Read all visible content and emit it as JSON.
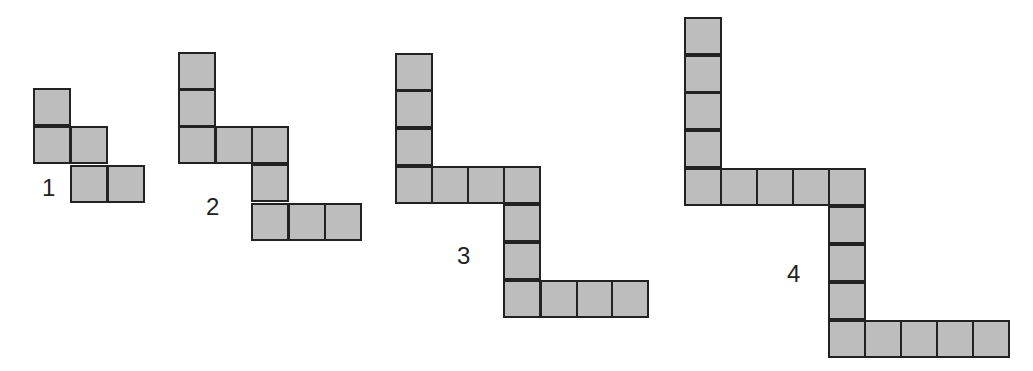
{
  "diagram": {
    "title": "",
    "colors": {
      "fill": "#bdbdbd",
      "stroke": "#222222",
      "background": "#ffffff"
    },
    "square_size": 38,
    "figures": [
      {
        "label": "1",
        "label_pos": [
          42,
          176
        ],
        "squares": [
          [
            33,
            88
          ],
          [
            33,
            126
          ],
          [
            70,
            126
          ],
          [
            70,
            165
          ],
          [
            107,
            165
          ]
        ]
      },
      {
        "label": "2",
        "label_pos": [
          206,
          195
        ],
        "squares": [
          [
            178,
            52
          ],
          [
            178,
            89
          ],
          [
            178,
            126
          ],
          [
            215,
            126
          ],
          [
            251,
            126
          ],
          [
            251,
            164
          ],
          [
            251,
            203
          ],
          [
            288,
            203
          ],
          [
            324,
            203
          ]
        ]
      },
      {
        "label": "3",
        "label_pos": [
          457,
          244
        ],
        "squares": [
          [
            395,
            53
          ],
          [
            395,
            90
          ],
          [
            395,
            128
          ],
          [
            395,
            166
          ],
          [
            431,
            166
          ],
          [
            467,
            166
          ],
          [
            503,
            166
          ],
          [
            503,
            204
          ],
          [
            503,
            242
          ],
          [
            503,
            280
          ],
          [
            540,
            280
          ],
          [
            576,
            280
          ],
          [
            611,
            280
          ]
        ]
      },
      {
        "label": "4",
        "label_pos": [
          787,
          262
        ],
        "squares": [
          [
            684,
            17
          ],
          [
            684,
            55
          ],
          [
            684,
            92
          ],
          [
            684,
            130
          ],
          [
            684,
            168
          ],
          [
            720,
            168
          ],
          [
            756,
            168
          ],
          [
            792,
            168
          ],
          [
            828,
            168
          ],
          [
            828,
            206
          ],
          [
            828,
            244
          ],
          [
            828,
            282
          ],
          [
            828,
            320
          ],
          [
            864,
            320
          ],
          [
            900,
            320
          ],
          [
            936,
            320
          ],
          [
            972,
            320
          ]
        ]
      }
    ]
  }
}
